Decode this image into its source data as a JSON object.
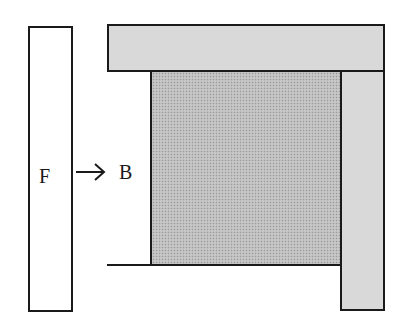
{
  "diagram": {
    "labels": {
      "f": "F",
      "b": "B"
    },
    "arrow": {
      "from": "F",
      "to": "B",
      "direction": "right"
    },
    "colors": {
      "outline": "#1a1a1a",
      "light_gray": "#d9d9d9",
      "stippled_gray": "#bdbdbd",
      "white": "#ffffff"
    },
    "regions": [
      {
        "id": "F",
        "fill": "white",
        "description": "separate vertical strip"
      },
      {
        "id": "top",
        "fill": "light gray"
      },
      {
        "id": "right",
        "fill": "light gray"
      },
      {
        "id": "center",
        "fill": "stippled gray"
      },
      {
        "id": "B",
        "fill": "white"
      },
      {
        "id": "bottom",
        "fill": "white"
      }
    ]
  }
}
